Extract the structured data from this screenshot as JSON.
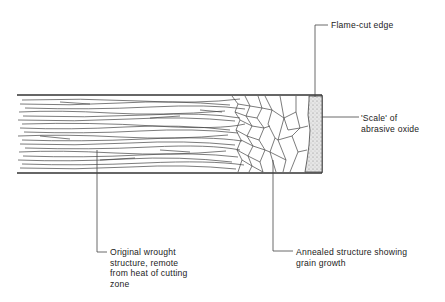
{
  "diagram": {
    "labels": {
      "flame_cut_edge": "Flame-cut edge",
      "scale": "'Scale' of\nabrasive oxide",
      "original_structure": "Original  wrought\nstructure, remote\nfrom heat of cutting\nzone",
      "annealed_structure": "Annealed structure showing\ngrain growth"
    },
    "colors": {
      "line": "#333333",
      "scale_fill": "#d8d8d8",
      "background": "#ffffff"
    },
    "bar": {
      "x": 17,
      "y": 95,
      "width": 305,
      "height": 78
    }
  }
}
